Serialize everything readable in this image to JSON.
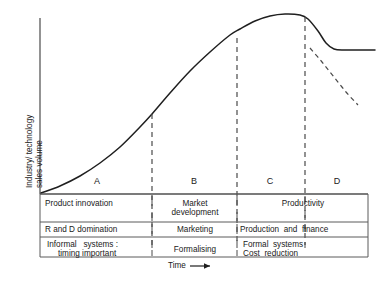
{
  "figure": {
    "ylabel_line1": "Industry/ technology",
    "ylabel_line2": "sales  volume",
    "xlabel": "Time",
    "xlabel_arrow": "⟶"
  },
  "stages": [
    {
      "letter": "A"
    },
    {
      "letter": "B"
    },
    {
      "letter": "C"
    },
    {
      "letter": "D"
    }
  ],
  "table": {
    "row1": {
      "a": "Product innovation",
      "b_line1": "Market",
      "b_line2": "development",
      "c": "Productivity"
    },
    "row2": {
      "a": "R and D domination",
      "b": "Marketing",
      "c": "Production  and  finance"
    },
    "row3": {
      "a_line1": "Informal   systems :",
      "a_line2": "timing important",
      "b": "Formalising",
      "c_line1": "Formal  systems",
      "c_line2": "Cost  reduction"
    }
  },
  "chart_data": {
    "type": "line",
    "title": "",
    "xlabel": "Time",
    "ylabel": "Industry/ technology sales volume",
    "grid": false,
    "legend": "none",
    "axis_origin": [
      40,
      194
    ],
    "xlim": [
      40,
      380
    ],
    "ylim": [
      194,
      14
    ],
    "series": [
      {
        "name": "industry-sales-volume",
        "style": "solid",
        "points": [
          [
            41,
            193
          ],
          [
            60,
            186
          ],
          [
            80,
            176
          ],
          [
            100,
            163
          ],
          [
            120,
            147
          ],
          [
            140,
            127
          ],
          [
            152,
            114
          ],
          [
            170,
            93
          ],
          [
            190,
            71
          ],
          [
            210,
            52
          ],
          [
            230,
            35
          ],
          [
            240,
            29
          ],
          [
            255,
            21
          ],
          [
            270,
            16
          ],
          [
            285,
            14
          ],
          [
            300,
            15
          ],
          [
            308,
            19
          ],
          [
            318,
            31
          ],
          [
            326,
            43
          ],
          [
            334,
            49
          ],
          [
            345,
            50
          ],
          [
            360,
            50
          ],
          [
            375,
            50
          ]
        ]
      },
      {
        "name": "decline-branch",
        "style": "dashed",
        "points": [
          [
            310,
            48
          ],
          [
            322,
            62
          ],
          [
            334,
            77
          ],
          [
            346,
            92
          ],
          [
            358,
            105
          ]
        ]
      }
    ],
    "dividers": [
      {
        "stage_boundary": "A|B",
        "x": 152,
        "y_top": 114,
        "y_bottom": 245,
        "style": "dashed"
      },
      {
        "stage_boundary": "B|C",
        "x": 237,
        "y_top": 38,
        "y_bottom": 245,
        "style": "dashed"
      },
      {
        "stage_boundary": "C|D",
        "x": 305,
        "y_top": 17,
        "y_bottom": 245,
        "style": "dashed"
      }
    ],
    "stage_label_positions": [
      {
        "label": "A",
        "x": 97
      },
      {
        "label": "B",
        "x": 194
      },
      {
        "label": "C",
        "x": 270
      },
      {
        "label": "D",
        "x": 337
      }
    ]
  }
}
